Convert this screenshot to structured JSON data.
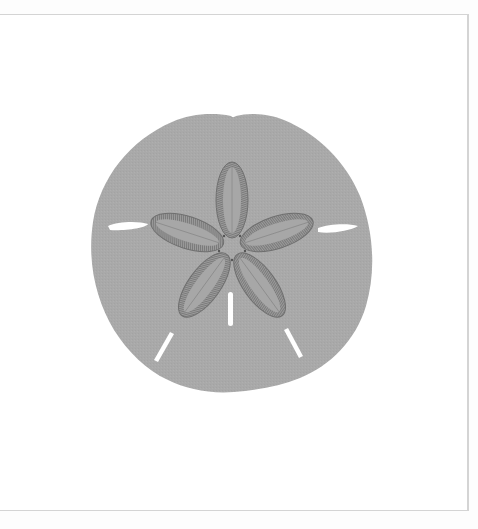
{
  "image": {
    "subject": "sand dollar",
    "description": "Grey silhouette of a sand dollar test with a five-petal petaloid star pattern and five slot-like lunules",
    "colors": {
      "background": "#fdfdfd",
      "frame_fill": "#ffffff",
      "frame_border": "#d4d4d4",
      "body": "#a9a9a9",
      "petal_outline": "#6f6f6f",
      "lunules": "#ffffff"
    },
    "petal_count": 5,
    "lunule_count": 5
  }
}
